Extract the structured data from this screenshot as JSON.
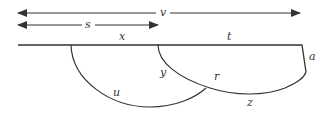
{
  "diagram": {
    "stroke_color": "#333333",
    "background": "#ffffff",
    "arrows": [
      {
        "id": "v",
        "label": "v",
        "from_x": 18,
        "to_x": 300,
        "y": 13,
        "direction": "both"
      },
      {
        "id": "s",
        "label": "s",
        "from_x": 18,
        "to_x": 158,
        "y": 25,
        "direction": "both"
      }
    ],
    "segment_labels": {
      "x": "x",
      "t": "t",
      "a": "a"
    },
    "curve_labels": {
      "u": "u",
      "y": "y",
      "r": "r",
      "z": "z"
    }
  }
}
